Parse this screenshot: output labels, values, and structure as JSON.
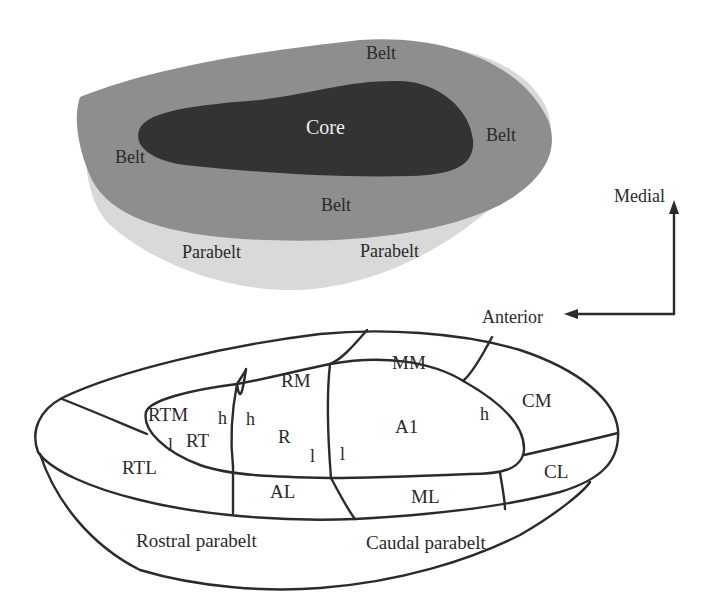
{
  "figure": {
    "top_panel": {
      "name": "auditory cortex schematic - core/belt/parabelt",
      "colors": {
        "parabelt": "#d8d8d8",
        "belt": "#8d8d8d",
        "core": "#333333",
        "background": "#ffffff"
      },
      "labels": {
        "core": "Core",
        "belt_top": "Belt",
        "belt_right": "Belt",
        "belt_left": "Belt",
        "belt_bottom": "Belt",
        "parabelt_left": "Parabelt",
        "parabelt_right": "Parabelt"
      }
    },
    "orientation": {
      "medial": "Medial",
      "anterior": "Anterior"
    },
    "bottom_panel": {
      "name": "auditory cortex subdivision map",
      "areas": {
        "RTM": "RTM",
        "RM": "RM",
        "MM": "MM",
        "CM": "CM",
        "RT": "RT",
        "R": "R",
        "A1": "A1",
        "RTL": "RTL",
        "AL": "AL",
        "ML": "ML",
        "CL": "CL",
        "rostral_parabelt": "Rostral parabelt",
        "caudal_parabelt": "Caudal parabelt"
      },
      "frequency_markers": {
        "rt_low": "l",
        "rt_high": "h",
        "r_high": "h",
        "r_low": "l",
        "a1_low": "l",
        "a1_high": "h"
      }
    }
  }
}
